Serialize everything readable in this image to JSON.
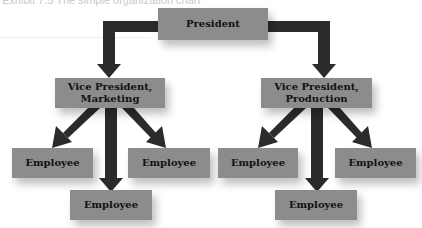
{
  "caption": "Exhibit 7.5 The simple organization chart",
  "colors": {
    "box_fill": "#8c8c8c",
    "arrow": "#2b2b2b",
    "text": "#111111",
    "background": "#ffffff"
  },
  "nodes": {
    "president": {
      "label": "President"
    },
    "vp_marketing": {
      "line1": "Vice President,",
      "line2": "Marketing"
    },
    "vp_production": {
      "line1": "Vice President,",
      "line2": "Production"
    },
    "marketing_employees": [
      {
        "label": "Employee"
      },
      {
        "label": "Employee"
      },
      {
        "label": "Employee"
      }
    ],
    "production_employees": [
      {
        "label": "Employee"
      },
      {
        "label": "Employee"
      },
      {
        "label": "Employee"
      }
    ]
  },
  "edges": [
    {
      "from": "President",
      "to": "Vice President, Marketing"
    },
    {
      "from": "President",
      "to": "Vice President, Production"
    },
    {
      "from": "Vice President, Marketing",
      "to": "Employee (left)"
    },
    {
      "from": "Vice President, Marketing",
      "to": "Employee (bottom)"
    },
    {
      "from": "Vice President, Marketing",
      "to": "Employee (right)"
    },
    {
      "from": "Vice President, Production",
      "to": "Employee (left)"
    },
    {
      "from": "Vice President, Production",
      "to": "Employee (bottom)"
    },
    {
      "from": "Vice President, Production",
      "to": "Employee (right)"
    }
  ]
}
